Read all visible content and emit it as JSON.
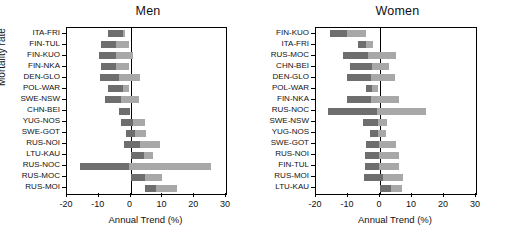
{
  "figure": {
    "yaxis_title": "Mortality rate",
    "xaxis_title": "Annual Trend (%)",
    "xticks": [
      "-20",
      "-10",
      "0",
      "10",
      "20",
      "30"
    ],
    "xlim": [
      -20,
      30
    ],
    "colors": {
      "negative_segment": "#6e6e6e",
      "positive_segment": "#a8a8a8",
      "axis": "#000000"
    }
  },
  "chart_data": [
    {
      "type": "bar",
      "orientation": "horizontal",
      "title": "Men",
      "xlabel": "Annual Trend (%)",
      "ylabel": "Mortality rate",
      "xlim": [
        -20,
        30
      ],
      "xticks": [
        -20,
        -10,
        0,
        10,
        20,
        30
      ],
      "grid": false,
      "legend": "none",
      "categories": [
        "ITA-FRI",
        "FIN-TUL",
        "FIN-KUO",
        "FIN-NKA",
        "DEN-GLO",
        "POL-WAR",
        "SWE-NSW",
        "CHN-BEI",
        "YUG-NOS",
        "SWE-GOT",
        "RUS-NOI",
        "LTU-KAU",
        "RUS-NOC",
        "RUS-MOC",
        "RUS-MOI"
      ],
      "series": [
        {
          "name": "lower bound",
          "values": [
            -7.2,
            -9.4,
            -10.0,
            -9.4,
            -9.7,
            -7.2,
            -8.1,
            -3.8,
            -3.1,
            -1.6,
            -2.2,
            0.0,
            -15.9,
            0.0,
            4.4
          ]
        },
        {
          "name": "upper bound",
          "values": [
            -1.9,
            -0.6,
            0.9,
            -0.6,
            2.8,
            -0.6,
            2.8,
            -0.1,
            4.4,
            5.0,
            9.1,
            7.2,
            25.3,
            10.0,
            14.7
          ]
        },
        {
          "name": "midpoint",
          "values": [
            -2.5,
            -4.7,
            -4.7,
            -4.7,
            -3.8,
            -2.5,
            -3.1,
            -0.1,
            0.6,
            1.3,
            3.1,
            4.1,
            -0.6,
            4.4,
            8.1
          ]
        }
      ]
    },
    {
      "type": "bar",
      "orientation": "horizontal",
      "title": "Women",
      "xlabel": "Annual Trend (%)",
      "ylabel": "Mortality rate",
      "xlim": [
        -20,
        30
      ],
      "xticks": [
        -20,
        -10,
        0,
        10,
        20,
        30
      ],
      "grid": false,
      "legend": "none",
      "categories": [
        "FIN-KUO",
        "ITA-FRI",
        "RUS-MOC",
        "CHN-BEI",
        "DEN-GLO",
        "POL-WAR",
        "FIN-NKA",
        "RUS-NOC",
        "SWE-NSW",
        "YUG-NOS",
        "SWE-GOT",
        "RUS-NOI",
        "FIN-TUL",
        "RUS-MOI",
        "LTU-KAU"
      ],
      "series": [
        {
          "name": "lower bound",
          "values": [
            -15.6,
            -6.9,
            -11.6,
            -9.4,
            -10.3,
            -4.4,
            -10.3,
            -16.3,
            -5.3,
            -3.1,
            -4.4,
            -4.7,
            -4.7,
            -5.0,
            0.0
          ]
        },
        {
          "name": "upper bound",
          "values": [
            -4.4,
            -2.2,
            5.0,
            2.8,
            4.7,
            -0.6,
            5.9,
            14.4,
            2.2,
            1.9,
            5.0,
            5.9,
            5.9,
            7.2,
            6.9
          ]
        },
        {
          "name": "midpoint",
          "values": [
            -10.3,
            -4.4,
            -3.8,
            -2.5,
            -2.8,
            -2.5,
            -2.8,
            -0.9,
            -0.6,
            -0.6,
            -0.3,
            -0.3,
            -0.3,
            0.9,
            3.4
          ]
        }
      ]
    }
  ]
}
